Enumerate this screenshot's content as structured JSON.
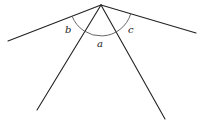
{
  "diagram": {
    "vertex": [
      101,
      5
    ],
    "rays": [
      {
        "name": "ray-left",
        "end": [
          8,
          41
        ]
      },
      {
        "name": "ray-lower-left",
        "end": [
          37,
          110
        ]
      },
      {
        "name": "ray-lower-right",
        "end": [
          165,
          119
        ]
      },
      {
        "name": "ray-right",
        "end": [
          196,
          33
        ]
      }
    ],
    "labels": {
      "a": "a",
      "b": "b",
      "c": "c"
    },
    "stroke_color": "#222222",
    "arc_color": "#555555"
  }
}
